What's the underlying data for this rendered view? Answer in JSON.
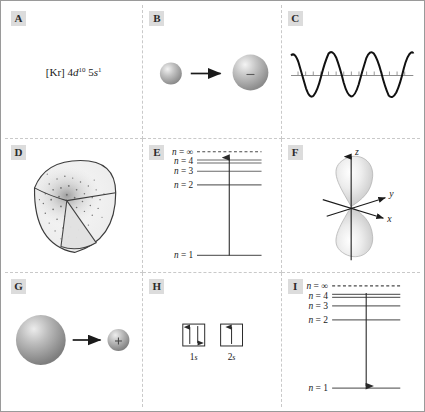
{
  "figure": {
    "rows": 3,
    "columns": 3,
    "border_color": "#9a9a9a",
    "divider_color": "#c9c9c9",
    "badge_background": "#dcdcdc",
    "background": "#ffffff"
  },
  "panels": [
    {
      "id": "A",
      "label": "A",
      "kind": "electron-configuration",
      "name": "electron-configuration-panel",
      "text": {
        "core": "[Kr]",
        "term1_n": "4",
        "term1_orbital": "d",
        "term1_count": "10",
        "term2_n": "5",
        "term2_orbital": "s",
        "term2_count": "1",
        "full": "[Kr] 4d10 5s1"
      }
    },
    {
      "id": "B",
      "label": "B",
      "kind": "anion-formation",
      "name": "anion-formation-panel",
      "left_sphere": {
        "radius": 11,
        "charge": ""
      },
      "right_sphere": {
        "radius": 18,
        "charge": "−"
      },
      "arrow": "right-arrow"
    },
    {
      "id": "C",
      "label": "C",
      "kind": "wave",
      "name": "wave-panel",
      "wave": {
        "cycles": 4,
        "amplitude": 22,
        "tick_count": 17,
        "axis": "horizontal"
      }
    },
    {
      "id": "D",
      "label": "D",
      "kind": "orbital-cutaway",
      "name": "orbital-cutaway-panel",
      "description": "1s electron density cutaway sphere"
    },
    {
      "id": "E",
      "label": "E",
      "kind": "energy-levels",
      "name": "energy-level-absorption-panel",
      "levels": [
        {
          "label": "n = ∞",
          "style": "dashed"
        },
        {
          "label": "n = 4",
          "style": "solid"
        },
        {
          "label": "n = 3",
          "style": "solid"
        },
        {
          "label": "n = 2",
          "style": "solid"
        },
        {
          "label": "n = 1",
          "style": "solid"
        }
      ],
      "transition": {
        "direction": "up",
        "from": "n = 1",
        "to": "n = 4",
        "meaning": "absorption"
      }
    },
    {
      "id": "F",
      "label": "F",
      "kind": "p-orbital",
      "name": "p-orbital-panel",
      "axes": [
        {
          "label": "z",
          "name": "axis-label-z"
        },
        {
          "label": "y",
          "name": "axis-label-y"
        },
        {
          "label": "x",
          "name": "axis-label-x"
        }
      ],
      "orbital": "pz"
    },
    {
      "id": "G",
      "label": "G",
      "kind": "cation-formation",
      "name": "cation-formation-panel",
      "left_sphere": {
        "radius": 25,
        "charge": ""
      },
      "right_sphere": {
        "radius": 11,
        "charge": "+"
      },
      "arrow": "right-arrow"
    },
    {
      "id": "H",
      "label": "H",
      "kind": "orbital-boxes",
      "name": "orbital-diagram-panel",
      "boxes": [
        {
          "label": "1s",
          "sublabel_n": "1",
          "sublabel_orbital": "s",
          "occupancy": "paired",
          "arrows": [
            "up",
            "down"
          ]
        },
        {
          "label": "2s",
          "sublabel_n": "2",
          "sublabel_orbital": "s",
          "occupancy": "single",
          "arrows": [
            "up"
          ]
        }
      ]
    },
    {
      "id": "I",
      "label": "I",
      "kind": "energy-levels",
      "name": "energy-level-emission-panel",
      "levels": [
        {
          "label": "n = ∞",
          "style": "dashed"
        },
        {
          "label": "n = 4",
          "style": "solid"
        },
        {
          "label": "n = 3",
          "style": "solid"
        },
        {
          "label": "n = 2",
          "style": "solid"
        },
        {
          "label": "n = 1",
          "style": "solid"
        }
      ],
      "transition": {
        "direction": "down",
        "from": "n = 4",
        "to": "n = 1",
        "meaning": "emission"
      }
    }
  ]
}
